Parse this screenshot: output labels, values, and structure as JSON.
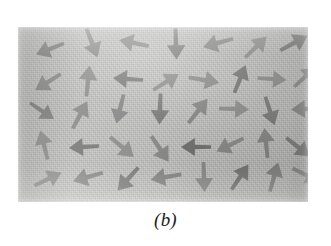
{
  "figure": {
    "caption": "(b)",
    "kind": "photograph",
    "plate": {
      "x": 18,
      "y": 27,
      "width": 290,
      "height": 175,
      "background_color": "#b0b0ae",
      "arrow_color": "#6f706e",
      "arrow_color_dark": "#5b5c5a",
      "page_color": "#ffffff"
    }
  },
  "chart_data": {
    "type": "scatter",
    "title": "(b)",
    "xlabel": "",
    "ylabel": "",
    "xlim": [
      0,
      290
    ],
    "ylim": [
      0,
      175
    ],
    "grid": false,
    "legend": null,
    "note": "Vector field of randomly oriented arrows (magnetic dipole moments in an unmagnetized sample). Each datum is an arrow: x,y = tail-to-head midpoint in plate pixels, angle = heading in degrees measured counter-clockwise from +x axis, len = arrow length in pixels.",
    "arrows": [
      {
        "x": 32,
        "y": 22,
        "angle": 202,
        "len": 30
      },
      {
        "x": 74,
        "y": 16,
        "angle": 291,
        "len": 31
      },
      {
        "x": 116,
        "y": 16,
        "angle": 168,
        "len": 30
      },
      {
        "x": 158,
        "y": 17,
        "angle": 272,
        "len": 31
      },
      {
        "x": 200,
        "y": 16,
        "angle": 196,
        "len": 31
      },
      {
        "x": 238,
        "y": 20,
        "angle": 44,
        "len": 30
      },
      {
        "x": 276,
        "y": 16,
        "angle": 28,
        "len": 31
      },
      {
        "x": 30,
        "y": 55,
        "angle": 212,
        "len": 30
      },
      {
        "x": 70,
        "y": 54,
        "angle": 84,
        "len": 31
      },
      {
        "x": 110,
        "y": 52,
        "angle": 176,
        "len": 30
      },
      {
        "x": 148,
        "y": 55,
        "angle": 32,
        "len": 30
      },
      {
        "x": 186,
        "y": 53,
        "angle": 350,
        "len": 31
      },
      {
        "x": 222,
        "y": 52,
        "angle": 68,
        "len": 30
      },
      {
        "x": 254,
        "y": 52,
        "angle": 356,
        "len": 29
      },
      {
        "x": 287,
        "y": 50,
        "angle": 42,
        "len": 29
      },
      {
        "x": 24,
        "y": 84,
        "angle": 326,
        "len": 29
      },
      {
        "x": 62,
        "y": 88,
        "angle": 62,
        "len": 31
      },
      {
        "x": 102,
        "y": 82,
        "angle": 256,
        "len": 30
      },
      {
        "x": 142,
        "y": 82,
        "angle": 268,
        "len": 31
      },
      {
        "x": 180,
        "y": 84,
        "angle": 52,
        "len": 31
      },
      {
        "x": 216,
        "y": 82,
        "angle": 358,
        "len": 30
      },
      {
        "x": 252,
        "y": 84,
        "angle": 288,
        "len": 30
      },
      {
        "x": 288,
        "y": 82,
        "angle": 182,
        "len": 30
      },
      {
        "x": 26,
        "y": 118,
        "angle": 104,
        "len": 30
      },
      {
        "x": 66,
        "y": 120,
        "angle": 184,
        "len": 30
      },
      {
        "x": 104,
        "y": 120,
        "angle": 320,
        "len": 31
      },
      {
        "x": 142,
        "y": 122,
        "angle": 304,
        "len": 31
      },
      {
        "x": 178,
        "y": 120,
        "angle": 180,
        "len": 30
      },
      {
        "x": 212,
        "y": 118,
        "angle": 206,
        "len": 30
      },
      {
        "x": 248,
        "y": 116,
        "angle": 96,
        "len": 30
      },
      {
        "x": 280,
        "y": 120,
        "angle": 322,
        "len": 30
      },
      {
        "x": 30,
        "y": 152,
        "angle": 26,
        "len": 30
      },
      {
        "x": 70,
        "y": 150,
        "angle": 196,
        "len": 31
      },
      {
        "x": 110,
        "y": 152,
        "angle": 228,
        "len": 31
      },
      {
        "x": 148,
        "y": 150,
        "angle": 190,
        "len": 31
      },
      {
        "x": 186,
        "y": 150,
        "angle": 272,
        "len": 30
      },
      {
        "x": 222,
        "y": 150,
        "angle": 56,
        "len": 30
      },
      {
        "x": 256,
        "y": 150,
        "angle": 74,
        "len": 30
      },
      {
        "x": 288,
        "y": 148,
        "angle": 334,
        "len": 30
      }
    ]
  }
}
